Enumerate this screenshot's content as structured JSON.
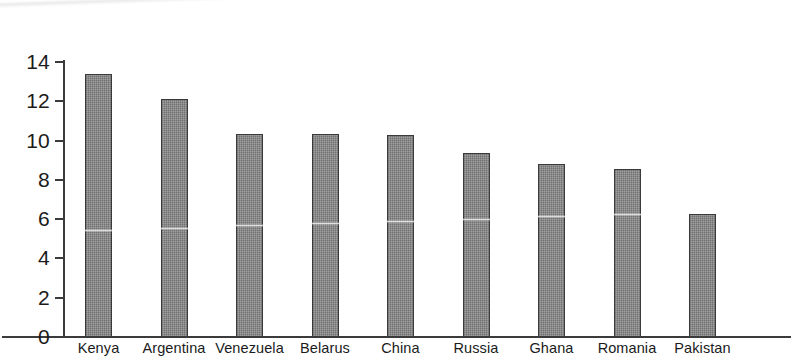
{
  "chart_data": {
    "type": "bar",
    "title": "",
    "subtitle": "",
    "xlabel": "",
    "ylabel": "",
    "categories": [
      "Kenya",
      "Argentina",
      "Venezuela",
      "Belarus",
      "China",
      "Russia",
      "Ghana",
      "Romania",
      "Pakistan"
    ],
    "values": [
      13.4,
      12.1,
      10.35,
      10.35,
      10.3,
      9.35,
      8.8,
      8.55,
      6.25
    ],
    "ylim": [
      0,
      14
    ],
    "ytick_labels": [
      "14",
      "12",
      "10",
      "8",
      "6",
      "4",
      "2",
      "0"
    ],
    "ytick_values": [
      14,
      12,
      10,
      8,
      6,
      4,
      2,
      0
    ],
    "grid": false,
    "legend": null,
    "series": [
      {
        "name": "",
        "values": [
          13.4,
          12.1,
          10.35,
          10.35,
          10.3,
          9.35,
          8.8,
          8.55,
          6.25
        ]
      }
    ],
    "colors": {
      "bar_fill": "#7e7e7e",
      "bar_outline": "#3a3a3a",
      "axis": "#3b3b3b",
      "text": "#1b1b1b",
      "background": "#ffffff"
    }
  }
}
